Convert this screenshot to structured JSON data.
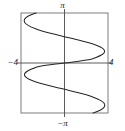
{
  "figure": {
    "name": "sideways-sinusoid-graph",
    "background_color": "#ffffff",
    "frame_color": "#6b6b6b",
    "axis_color": "#4d4d4d",
    "curve_color": "#2b2b2b"
  },
  "labels": {
    "top": "π",
    "bottom": "−π",
    "left": "−4",
    "right": "4"
  },
  "chart_data": {
    "type": "line",
    "title": "",
    "xlabel": "",
    "ylabel": "",
    "xlim": [
      -4,
      4
    ],
    "ylim": [
      -3.14159,
      3.14159
    ],
    "xticks": [
      -4,
      4
    ],
    "xticklabels": [
      "−4",
      "4"
    ],
    "yticks": [
      -3.14159,
      3.14159
    ],
    "yticklabels": [
      "−π",
      "π"
    ],
    "grid": false,
    "legend": null,
    "frame": "box",
    "series": [
      {
        "name": "x = 3.7 sin(1.5 y)",
        "orientation": "x-as-function-of-y",
        "y": [
          -3.14159,
          -2.95,
          -2.75,
          -2.55,
          -2.35,
          -2.15,
          -2.0,
          -1.85,
          -1.7,
          -1.55,
          -1.4,
          -1.25,
          -1.1,
          -0.95,
          -0.8,
          -0.65,
          -0.5,
          -0.35,
          -0.2,
          0.0,
          0.2,
          0.35,
          0.5,
          0.65,
          0.8,
          0.95,
          1.1,
          1.25,
          1.4,
          1.55,
          1.7,
          1.85,
          2.0,
          2.15,
          2.35,
          2.55,
          2.75,
          2.95,
          3.14159
        ],
        "x": [
          2.62,
          3.32,
          3.67,
          3.66,
          3.3,
          2.65,
          2.0,
          1.19,
          0.29,
          -0.63,
          -1.53,
          -2.33,
          -2.98,
          -3.44,
          -3.66,
          -3.65,
          -3.39,
          -2.9,
          -2.23,
          0.0,
          2.23,
          2.9,
          3.39,
          3.65,
          3.66,
          3.44,
          2.98,
          2.33,
          1.53,
          0.63,
          -0.29,
          -1.19,
          -2.0,
          -2.65,
          -3.3,
          -3.66,
          -3.67,
          -3.32,
          -2.62
        ]
      }
    ],
    "x_extrema": {
      "max_x_value": 3.7,
      "min_x_value": -3.7
    }
  },
  "geometry": {
    "frame_left_px": 21,
    "frame_right_px": 108,
    "frame_top_px": 13,
    "frame_bottom_px": 113,
    "origin_x_px": 64.5,
    "origin_y_px": 63
  }
}
